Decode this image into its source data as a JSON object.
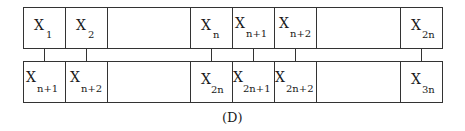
{
  "diagram": {
    "top_row": [
      {
        "main": "X",
        "sub": "1"
      },
      {
        "main": "X",
        "sub": "2"
      },
      {
        "main": "",
        "sub": ""
      },
      {
        "main": "X",
        "sub": "n"
      },
      {
        "main": "X",
        "sub": "n+1"
      },
      {
        "main": "X",
        "sub": "n+2"
      },
      {
        "main": "",
        "sub": ""
      },
      {
        "main": "X",
        "sub": "2n"
      }
    ],
    "bottom_row": [
      {
        "main": "X",
        "sub": "n+1"
      },
      {
        "main": "X",
        "sub": "n+2"
      },
      {
        "main": "",
        "sub": ""
      },
      {
        "main": "X",
        "sub": "2n"
      },
      {
        "main": "X",
        "sub": "2n+1"
      },
      {
        "main": "X",
        "sub": "2n+2"
      },
      {
        "main": "",
        "sub": ""
      },
      {
        "main": "X",
        "sub": "3n"
      }
    ],
    "caption": "(D)"
  }
}
